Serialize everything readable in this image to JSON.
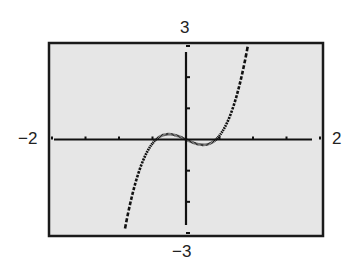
{
  "chart_data": {
    "type": "line",
    "title": "",
    "xlabel": "",
    "ylabel": "",
    "xlim": [
      -2,
      2
    ],
    "ylim": [
      -3,
      3
    ],
    "x_scale": 0.5,
    "y_scale": 1,
    "grid": false,
    "window_labels": {
      "xmin": "−2",
      "xmax": "2",
      "ymin": "−3",
      "ymax": "3"
    },
    "series": [
      {
        "name": "y = 5x^3 - x",
        "x": [
          -0.91,
          -0.8,
          -0.7,
          -0.6,
          -0.5,
          -0.4,
          -0.3,
          -0.258,
          -0.2,
          -0.1,
          0,
          0.1,
          0.2,
          0.258,
          0.3,
          0.4,
          0.5,
          0.6,
          0.7,
          0.8,
          0.9
        ],
        "y": [
          -2.86,
          -1.76,
          -1.02,
          -0.48,
          -0.13,
          0.08,
          0.17,
          0.17,
          0.16,
          0.1,
          0,
          -0.1,
          -0.16,
          -0.17,
          -0.17,
          -0.08,
          0.13,
          0.48,
          1.02,
          1.76,
          2.75
        ]
      }
    ],
    "colors": {
      "background": "#e6e6e6",
      "frame": "#1a1a1a",
      "curve": "#111111"
    }
  }
}
